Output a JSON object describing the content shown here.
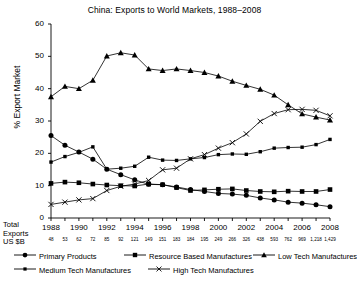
{
  "chart_data": {
    "type": "line",
    "title": "China: Exports to World Markets, 1988–2008",
    "xlabel": "",
    "ylabel": "% Export Market",
    "ylim": [
      0,
      60
    ],
    "yticks": [
      0,
      10,
      20,
      30,
      40,
      50,
      60
    ],
    "grid": false,
    "legend_position": "bottom",
    "categories": [
      1988,
      1989,
      1990,
      1991,
      1992,
      1993,
      1994,
      1995,
      1996,
      1997,
      1998,
      1999,
      2000,
      2001,
      2002,
      2003,
      2004,
      2005,
      2006,
      2007,
      2008
    ],
    "xticks_shown": [
      "1988",
      "1990",
      "1992",
      "1994",
      "1996",
      "1998",
      "2000",
      "2002",
      "2004",
      "2006",
      "2008"
    ],
    "secondary_axis_label": "Total Exports US $B",
    "secondary_axis_values": [
      "48",
      "53",
      "62",
      "72",
      "85",
      "92",
      "121",
      "149",
      "151",
      "183",
      "184",
      "195",
      "249",
      "266",
      "326",
      "438",
      "593",
      "762",
      "969",
      "1,218",
      "1,429"
    ],
    "series": [
      {
        "name": "Primary Products",
        "marker": "filled-circle",
        "values": [
          25.5,
          22.5,
          20.4,
          18.2,
          15.1,
          13.4,
          11.8,
          10.4,
          10.3,
          9.6,
          8.8,
          8.2,
          7.6,
          7.4,
          7.0,
          6.2,
          5.6,
          4.9,
          4.6,
          4.1,
          3.5
        ]
      },
      {
        "name": "Resource Based Manufactures",
        "marker": "filled-square",
        "values": [
          10.7,
          11.1,
          10.9,
          10.5,
          10.2,
          10.0,
          9.9,
          10.5,
          10.3,
          9.4,
          8.5,
          8.7,
          8.9,
          9.0,
          8.5,
          8.2,
          8.1,
          8.3,
          8.2,
          8.2,
          8.8
        ]
      },
      {
        "name": "Low Tech Manufactures",
        "marker": "filled-triangle",
        "values": [
          37.5,
          40.7,
          40.0,
          42.6,
          50.1,
          51.1,
          50.4,
          46.1,
          45.6,
          46.1,
          45.6,
          45.0,
          43.9,
          42.3,
          41.0,
          39.8,
          38.0,
          35.0,
          32.2,
          31.2,
          30.3
        ]
      },
      {
        "name": "Medium Tech Manufactures",
        "marker": "filled-small-square",
        "values": [
          17.3,
          19.0,
          20.3,
          22.0,
          15.1,
          15.4,
          16.0,
          18.8,
          17.9,
          17.8,
          18.3,
          18.7,
          19.6,
          19.8,
          19.7,
          20.5,
          21.6,
          21.8,
          21.9,
          22.7,
          24.3
        ]
      },
      {
        "name": "High Tech Manufactures",
        "marker": "x-cross",
        "values": [
          4.2,
          4.9,
          5.6,
          6.0,
          8.5,
          9.8,
          10.5,
          11.6,
          14.9,
          15.4,
          18.3,
          19.6,
          21.6,
          23.3,
          26.0,
          29.9,
          32.3,
          33.5,
          33.6,
          33.3,
          31.6
        ]
      }
    ]
  },
  "legend": {
    "items": [
      {
        "label": "Primary Products",
        "marker": "filled-circle"
      },
      {
        "label": "Resource Based Manufactures",
        "marker": "filled-square"
      },
      {
        "label": "Low Tech Manufactures",
        "marker": "filled-triangle"
      },
      {
        "label": "Medium Tech Manufactures",
        "marker": "filled-small-square"
      },
      {
        "label": "High Tech Manufactures",
        "marker": "x-cross"
      }
    ]
  },
  "axis_note": {
    "line1": "Total",
    "line2": "Exports",
    "line3": "US $B"
  },
  "colors": {
    "line": "#000000",
    "axis": "#000000",
    "background": "#ffffff"
  }
}
